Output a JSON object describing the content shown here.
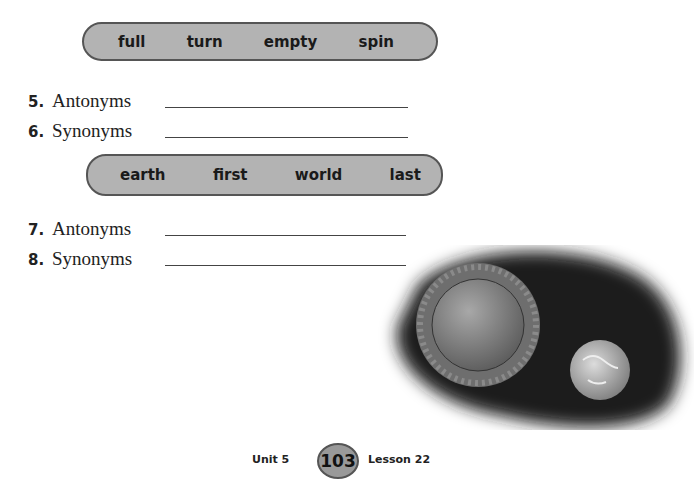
{
  "word_boxes": [
    {
      "words": [
        "full",
        "turn",
        "empty",
        "spin"
      ]
    },
    {
      "words": [
        "earth",
        "first",
        "world",
        "last"
      ]
    }
  ],
  "items": [
    {
      "number": "5.",
      "label": "Antonyms"
    },
    {
      "number": "6.",
      "label": "Synonyms"
    },
    {
      "number": "7.",
      "label": "Antonyms"
    },
    {
      "number": "8.",
      "label": "Synonyms"
    }
  ],
  "illustration": {
    "description": "sun-and-earth-illustration"
  },
  "footer": {
    "unit": "Unit 5",
    "page": "103",
    "lesson": "Lesson 22"
  },
  "colors": {
    "box_fill": "#b3b3b3",
    "box_border": "#555555",
    "badge_fill": "#999999"
  }
}
